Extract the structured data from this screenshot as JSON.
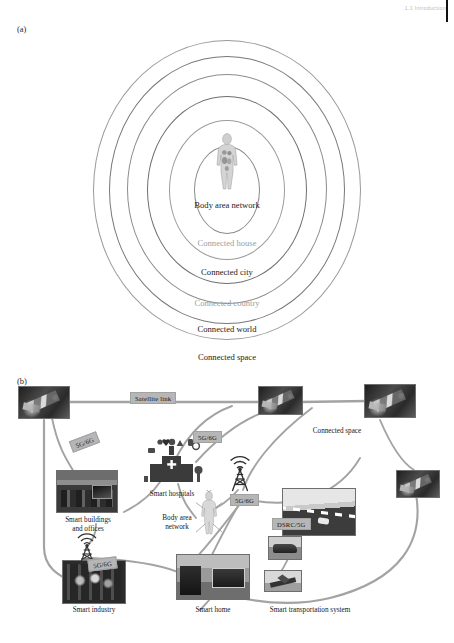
{
  "page": {
    "running_header": "1.1 Introduction"
  },
  "panels": {
    "a": {
      "letter": "(a)",
      "center_icon": "human-body-figure-icon",
      "rings": [
        {
          "label": "Body area\nnetwork",
          "tone": "dark"
        },
        {
          "label": "Connected house",
          "tone": "light"
        },
        {
          "label": "Connected city",
          "tone": "dark"
        },
        {
          "label": "Connected country",
          "tone": "light"
        },
        {
          "label": "Connected world",
          "tone": "dark"
        },
        {
          "label": "Connected space",
          "tone": "dark"
        }
      ]
    },
    "b": {
      "letter": "(b)",
      "tags": [
        {
          "id": "satellite-link",
          "text": "Satellite link"
        },
        {
          "id": "tag-5g6g-upper-left",
          "text": "5G/6G"
        },
        {
          "id": "tag-5g6g-upper-mid",
          "text": "5G/6G"
        },
        {
          "id": "tag-5g6g-tower",
          "text": "5G/6G"
        },
        {
          "id": "tag-5g6g-lower-left",
          "text": "5G/6G"
        },
        {
          "id": "tag-dsrc-5g",
          "text": "DSRC/5G"
        }
      ],
      "nodes": [
        {
          "id": "connected-space",
          "label": "Connected space",
          "icon": "satellite-photo"
        },
        {
          "id": "smart-hospitals",
          "label": "Smart hospitals",
          "icon": "hospital-icon-cluster"
        },
        {
          "id": "smart-buildings-offices",
          "label": "Smart buildings\nand offices",
          "icon": "office-photo"
        },
        {
          "id": "smart-industry",
          "label": "Smart industry",
          "icon": "industry-photo"
        },
        {
          "id": "body-area-network",
          "label": "Body area\nnetwork",
          "icon": "human-body-figure-icon"
        },
        {
          "id": "smart-home",
          "label": "Smart home",
          "icon": "living-room-photo"
        },
        {
          "id": "smart-transportation-system",
          "label": "Smart transportation system",
          "icon": "highway-v2x-photo"
        }
      ],
      "cell_tower_icon": "cell-tower-icon"
    }
  },
  "colors": {
    "ring_dark": "#1b1b1b",
    "ring_light": "#9d9d9d",
    "tag_bg": "#b6b6b6",
    "link_line": "#9e9e9e",
    "photo_border": "#6e6e6e"
  }
}
